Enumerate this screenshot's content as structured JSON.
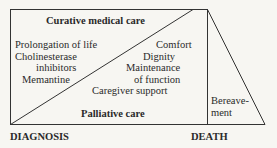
{
  "diagram": {
    "curative_title": "Curative medical care",
    "palliative_title": "Palliative care",
    "curative_items": [
      "Prolongation of life",
      "Cholinesterase",
      "inhibitors",
      "Memantine"
    ],
    "palliative_items": [
      "Comfort",
      "Dignity",
      "Maintenance",
      "of function",
      "Caregiver support"
    ],
    "bereavement": [
      "Bereave-",
      "ment"
    ],
    "axis_start": "DIAGNOSIS",
    "axis_end": "DEATH"
  }
}
